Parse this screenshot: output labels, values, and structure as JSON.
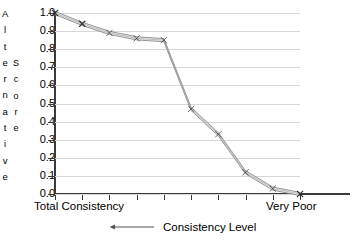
{
  "chart_data": {
    "type": "line",
    "title": "",
    "xlabel": "Consistency Level",
    "ylabel": "Alternative Score",
    "ylabel_parts": [
      "Alternative",
      "Score"
    ],
    "ylim": [
      0.0,
      1.0
    ],
    "xlim": [
      0,
      9
    ],
    "grid": true,
    "legend_position": "bottom",
    "y_ticks": [
      "1.0",
      "0.9",
      "0.8",
      "0.7",
      "0.6",
      "0.5",
      "0.4",
      "0.3",
      "0.2",
      "0.1",
      "0.0"
    ],
    "y_tick_values": [
      1.0,
      0.9,
      0.8,
      0.7,
      0.6,
      0.5,
      0.4,
      0.3,
      0.2,
      0.1,
      0.0
    ],
    "x_axis_labels": {
      "left": "Total Consistency",
      "right": "Very Poor"
    },
    "x_tick_count": 10,
    "categories": [
      "Total Consistency",
      "",
      "",
      "",
      "",
      "",
      "",
      "",
      "",
      "Very Poor"
    ],
    "series": [
      {
        "name": "Consistency Level",
        "marker": "x",
        "line_color": "#7f7f7f",
        "fill_color": "#ebebeb",
        "values": [
          1.0,
          0.94,
          0.89,
          0.86,
          0.85,
          0.47,
          0.33,
          0.12,
          0.03,
          0.0
        ]
      }
    ],
    "annotations": []
  },
  "legend": {
    "label": "Consistency   Level",
    "arrow_direction": "left"
  },
  "axis": {
    "x_left_label": "Total    Consistency",
    "x_right_label": "Very Poor"
  },
  "colors": {
    "axis": "#3a3a3a",
    "grid": "#d8d8dc",
    "line": "#7f7f7f",
    "fill": "#ebebeb",
    "text": "#000000"
  }
}
